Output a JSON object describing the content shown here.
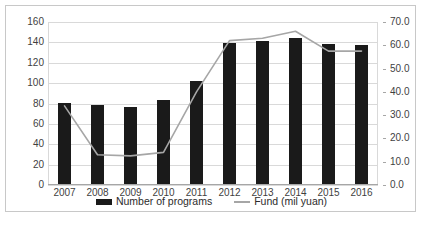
{
  "chart_data": {
    "type": "bar",
    "title": "",
    "xlabel": "",
    "ylabel": "",
    "grid": true,
    "legend_position": "bottom",
    "categories": [
      "2007",
      "2008",
      "2009",
      "2010",
      "2011",
      "2012",
      "2013",
      "2014",
      "2015",
      "2016"
    ],
    "series": [
      {
        "name": "Number of programs",
        "type": "bar",
        "axis": "left",
        "color": "#1a1a1a",
        "values": [
          80,
          78,
          76,
          82,
          101,
          138,
          140,
          143,
          137,
          136
        ]
      },
      {
        "name": "Fund (mil yuan)",
        "type": "line",
        "axis": "right",
        "color": "#a6a6a6",
        "values": [
          34.0,
          13.0,
          12.5,
          14.0,
          40.0,
          62.0,
          63.0,
          66.0,
          57.5,
          57.5
        ]
      }
    ],
    "left_axis": {
      "ylim": [
        0,
        160
      ],
      "ticks": [
        0,
        20,
        40,
        60,
        80,
        100,
        120,
        140,
        160
      ],
      "tick_labels": [
        "0",
        "20",
        "40",
        "60",
        "80",
        "100",
        "120",
        "140",
        "160"
      ]
    },
    "right_axis": {
      "ylim": [
        0,
        70
      ],
      "ticks": [
        0,
        10,
        20,
        30,
        40,
        50,
        60,
        70
      ],
      "tick_labels": [
        "0.0",
        "10.0",
        "20.0",
        "30.0",
        "40.0",
        "50.0",
        "60.0",
        "70.0"
      ]
    }
  },
  "legend": {
    "items": [
      {
        "label": "Number of programs",
        "marker": "bar-swatch"
      },
      {
        "label": "Fund (mil yuan)",
        "marker": "line-swatch"
      }
    ]
  },
  "colors": {
    "bar": "#1a1a1a",
    "line": "#a6a6a6",
    "grid": "#d9d9d9",
    "axis": "#a6a6a6",
    "border": "#c8c8c8",
    "text": "#3f3f3f",
    "background": "#ffffff"
  }
}
